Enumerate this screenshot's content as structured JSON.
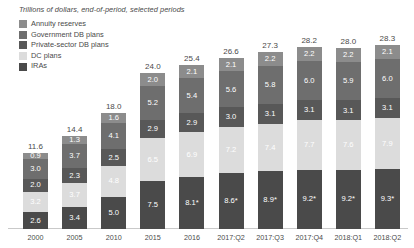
{
  "subtitle": "Trillions of dollars, end-of-period, selected periods",
  "colors": {
    "annuity_reserves": "#8c8c8c",
    "government_db": "#6e6e6e",
    "private_db": "#585858",
    "dc_plans": "#dcdcdc",
    "iras": "#4a4a4a",
    "axis": "#c9c9c9",
    "text": "#4a4a4a",
    "label_light": "#ffffff",
    "label_dark": "#f2f2f2",
    "label_on_light": "#ffffff"
  },
  "legend": {
    "items": [
      {
        "label": "Annuity reserves",
        "key": "annuity_reserves"
      },
      {
        "label": "Government DB plans",
        "key": "government_db"
      },
      {
        "label": "Private-sector DB plans",
        "key": "private_db"
      },
      {
        "label": "DC plans",
        "key": "dc_plans"
      },
      {
        "label": "IRAs",
        "key": "iras"
      }
    ]
  },
  "chart_data": {
    "type": "bar",
    "subtype": "stacked-vertical",
    "title": "",
    "subtitle": "Trillions of dollars, end-of-period, selected periods",
    "xlabel": "",
    "ylabel": "Trillions of dollars",
    "ylim": [
      0,
      28.3
    ],
    "grid": false,
    "legend_position": "top-left",
    "stack_order_bottom_to_top": [
      "IRAs",
      "DC plans",
      "Private-sector DB plans",
      "Government DB plans",
      "Annuity reserves"
    ],
    "categories": [
      "2000",
      "2005",
      "2010",
      "2015",
      "2016",
      "2017:Q2",
      "2017:Q3",
      "2017:Q4",
      "2018:Q1",
      "2018:Q2"
    ],
    "totals": [
      11.6,
      14.4,
      18.0,
      24.0,
      25.4,
      26.6,
      27.3,
      28.2,
      28.0,
      28.3
    ],
    "series": [
      {
        "name": "IRAs",
        "values": [
          2.6,
          3.4,
          5.0,
          7.5,
          8.1,
          8.6,
          8.9,
          9.2,
          9.2,
          9.3
        ]
      },
      {
        "name": "DC plans",
        "values": [
          3.2,
          3.7,
          4.8,
          6.5,
          6.9,
          7.2,
          7.4,
          7.7,
          7.6,
          7.9
        ]
      },
      {
        "name": "Private-sector DB plans",
        "values": [
          2.0,
          2.3,
          2.5,
          2.9,
          2.9,
          3.0,
          3.1,
          3.1,
          3.1,
          3.1
        ]
      },
      {
        "name": "Government DB plans",
        "values": [
          3.0,
          3.7,
          4.1,
          5.2,
          5.4,
          5.6,
          5.8,
          6.0,
          5.9,
          6.0
        ]
      },
      {
        "name": "Annuity reserves",
        "values": [
          0.9,
          1.3,
          1.6,
          2.0,
          2.1,
          2.1,
          2.2,
          2.2,
          2.2,
          2.1
        ]
      }
    ],
    "bar_labels": [
      {
        "category": "2000",
        "total": "11.6",
        "segments": [
          "2.6",
          "3.2",
          "2.0",
          "3.0",
          "0.9"
        ]
      },
      {
        "category": "2005",
        "total": "14.4",
        "segments": [
          "3.4",
          "3.7",
          "2.3",
          "3.7",
          "1.3"
        ]
      },
      {
        "category": "2010",
        "total": "18.0",
        "segments": [
          "5.0",
          "4.8",
          "2.5",
          "4.1",
          "1.6"
        ]
      },
      {
        "category": "2015",
        "total": "24.0",
        "segments": [
          "7.5",
          "6.5",
          "2.9",
          "5.2",
          "2.0"
        ]
      },
      {
        "category": "2016",
        "total": "25.4",
        "segments": [
          "8.1*",
          "6.9",
          "2.9",
          "5.4",
          "2.1"
        ]
      },
      {
        "category": "2017:Q2",
        "total": "26.6",
        "segments": [
          "8.6*",
          "7.2",
          "3.0",
          "5.6",
          "2.1"
        ]
      },
      {
        "category": "2017:Q3",
        "total": "27.3",
        "segments": [
          "8.9*",
          "7.4",
          "3.1",
          "5.8",
          "2.2"
        ]
      },
      {
        "category": "2017:Q4",
        "total": "28.2",
        "segments": [
          "9.2*",
          "7.7",
          "3.1",
          "6.0",
          "2.2"
        ]
      },
      {
        "category": "2018:Q1",
        "total": "28.0",
        "segments": [
          "9.2*",
          "7.6",
          "3.1",
          "5.9",
          "2.2"
        ]
      },
      {
        "category": "2018:Q2",
        "total": "28.3",
        "segments": [
          "9.3*",
          "7.9",
          "3.1",
          "6.0",
          "2.1"
        ]
      }
    ]
  }
}
